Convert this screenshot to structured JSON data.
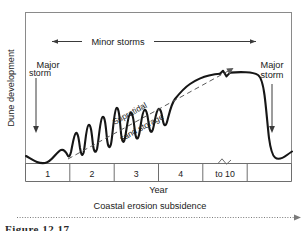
{
  "figure": {
    "caption_partial": "Figure 12.17",
    "axes": {
      "y_label": "Dune development",
      "x_label": "Year",
      "x_segments": [
        "1",
        "2",
        "3",
        "4",
        "to 10",
        ""
      ],
      "x_axis_has_break": true,
      "break_segment_index": 4
    },
    "annotations": {
      "minor_storms": "Minor storms",
      "major_storm_left": "Major storm",
      "major_storm_right": "Major storm",
      "supratidal_line1": "Supratidal",
      "supratidal_line2": "sand storage",
      "coastal_erosion": "Coastal erosion subsidence"
    },
    "colors": {
      "curve": "#161616",
      "frame": "#8a8a8a",
      "annotation": "#3a3a3a",
      "dashed": "#5a5a5a",
      "dotted": "#7a7a7a",
      "background": "#ffffff"
    }
  },
  "chart_data": {
    "type": "line",
    "title": "",
    "xlabel": "Year",
    "ylabel": "Dune development",
    "xlim": [
      0,
      6
    ],
    "ylim": [
      0,
      1
    ],
    "grid": false,
    "legend": null,
    "categories": [
      "1",
      "2",
      "3",
      "4",
      "to 10",
      ""
    ],
    "series": [
      {
        "name": "Dune development",
        "x": [
          0.0,
          0.22,
          0.46,
          0.72,
          0.92,
          1.02,
          1.12,
          1.24,
          1.32,
          1.44,
          1.52,
          1.64,
          1.72,
          1.86,
          1.94,
          2.08,
          2.16,
          2.32,
          2.4,
          2.58,
          2.66,
          2.86,
          2.96,
          3.2,
          3.34,
          3.6,
          3.8,
          4.1,
          4.4,
          4.75,
          5.0,
          5.12,
          5.22,
          5.34,
          5.52,
          5.78,
          6.0
        ],
        "values": [
          0.26,
          0.19,
          0.16,
          0.22,
          0.2,
          0.33,
          0.22,
          0.44,
          0.25,
          0.52,
          0.3,
          0.6,
          0.35,
          0.66,
          0.42,
          0.62,
          0.46,
          0.64,
          0.5,
          0.66,
          0.54,
          0.62,
          0.58,
          0.66,
          0.64,
          0.74,
          0.8,
          0.84,
          0.855,
          0.855,
          0.85,
          0.7,
          0.4,
          0.2,
          0.155,
          0.16,
          0.22
        ]
      }
    ],
    "annotations": [
      {
        "name": "minor-storms-span",
        "label": "Minor storms",
        "from_x": 0.52,
        "to_x": 5.1,
        "y": 0.97,
        "style": "double-arrow"
      },
      {
        "name": "major-storm-left",
        "label": "Major storm",
        "x": 0.3,
        "y_from": 0.78,
        "y_to": 0.3,
        "style": "down-arrow"
      },
      {
        "name": "major-storm-right",
        "label": "Major storm",
        "x": 5.52,
        "y_from": 0.78,
        "y_to": 0.27,
        "style": "down-arrow"
      },
      {
        "name": "supratidal-trend",
        "label": "Supratidal sand storage",
        "from_x": 0.95,
        "from_y": 0.05,
        "to_x": 4.4,
        "to_y": 0.78,
        "style": "dashed-arrow"
      },
      {
        "name": "coastal-erosion-subsidence",
        "label": "Coastal erosion subsidence",
        "style": "dotted-arrow-right"
      }
    ],
    "curve_breaks": [
      {
        "name": "plateau-break",
        "x": 4.4,
        "y": 0.855
      },
      {
        "name": "axis-break",
        "x": 4.52,
        "y": 0.0
      }
    ]
  }
}
